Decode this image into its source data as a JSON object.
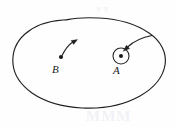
{
  "figure": {
    "caption": "",
    "background_color": "#fefefe",
    "ink_color": "#231f20",
    "width": 177,
    "height": 126,
    "region": {
      "name": "closed-region-boundary",
      "description": "irregular closed oval outline",
      "stroke_color": "#231f20"
    },
    "points": [
      {
        "label": "B",
        "dot_x": 61,
        "dot_y": 57,
        "label_x": 52,
        "label_y": 64,
        "has_enclosing_circle": false,
        "vector": {
          "name": "tangent-vector-B",
          "direction": "up-right",
          "curved": true
        }
      },
      {
        "label": "A",
        "dot_x": 121,
        "dot_y": 56,
        "label_x": 113,
        "label_y": 65,
        "has_enclosing_circle": true,
        "circle_radius": 8,
        "vector": {
          "name": "incoming-vector-A",
          "direction": "down-left",
          "curved": true
        }
      }
    ],
    "smudges": {
      "bottom_text": "MMM",
      "top_text": "vv"
    }
  }
}
